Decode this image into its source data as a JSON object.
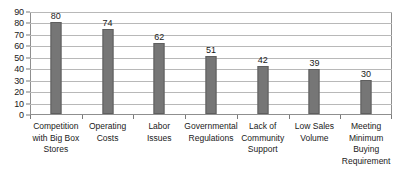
{
  "chart_data": {
    "type": "bar",
    "title": "",
    "subtitle": "",
    "xlabel": "",
    "ylabel": "",
    "ylim": [
      0,
      90
    ],
    "ytick_step": 10,
    "yticks": [
      90,
      80,
      70,
      60,
      50,
      40,
      30,
      20,
      10,
      0
    ],
    "grid": true,
    "grid_axis": "y",
    "legend": false,
    "legend_position": "none",
    "categories": [
      "Competition\nwith Big Box\nStores",
      "Operating\nCosts",
      "Labor\nIssues",
      "Governmental\nRegulations",
      "Lack of\nCommunity\nSupport",
      "Low Sales\nVolume",
      "Meeting\nMinimum\nBuying\nRequirement"
    ],
    "values": [
      80,
      74,
      62,
      51,
      42,
      39,
      30
    ],
    "data_labels": [
      "80",
      "74",
      "62",
      "51",
      "42",
      "39",
      "30"
    ],
    "series": [
      {
        "name": "",
        "values": [
          80,
          74,
          62,
          51,
          42,
          39,
          30
        ]
      }
    ]
  },
  "style": {
    "bar_fill": "#767676",
    "bar_edge": "#5e5e5e",
    "gridline": "#b8b8b8",
    "axis_line": "#8f8f8f",
    "text": "#1a1a1a",
    "background": "#ffffff"
  }
}
